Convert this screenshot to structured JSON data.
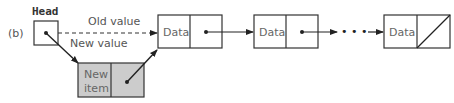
{
  "figure": {
    "part_label": "(b)",
    "head_label": "Head",
    "old_value_label": "Old value",
    "new_value_label": "New value",
    "new_item": {
      "line1": "New",
      "line2": "item",
      "fill": "#cccccc"
    },
    "nodes": [
      {
        "label": "Data",
        "pointer": "next"
      },
      {
        "label": "Data",
        "pointer": "next"
      },
      {
        "label": "Data",
        "pointer": "null"
      }
    ],
    "ellipsis": "• • •",
    "colors": {
      "stroke": "#333333",
      "text": "#666666",
      "new_item_fill": "#cccccc"
    }
  }
}
